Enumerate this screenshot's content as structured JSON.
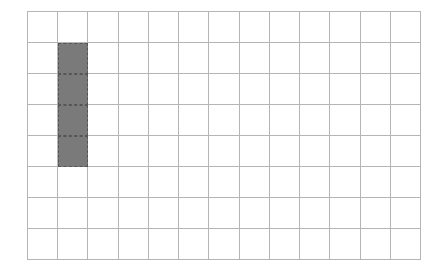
{
  "grid": {
    "columns": 13,
    "rows": 8,
    "line_color": "#b5b5b5",
    "fill_color": "#7a7a7a",
    "filled_cells": [
      {
        "row": 1,
        "col": 1
      },
      {
        "row": 2,
        "col": 1
      },
      {
        "row": 3,
        "col": 1
      },
      {
        "row": 4,
        "col": 1
      }
    ]
  }
}
